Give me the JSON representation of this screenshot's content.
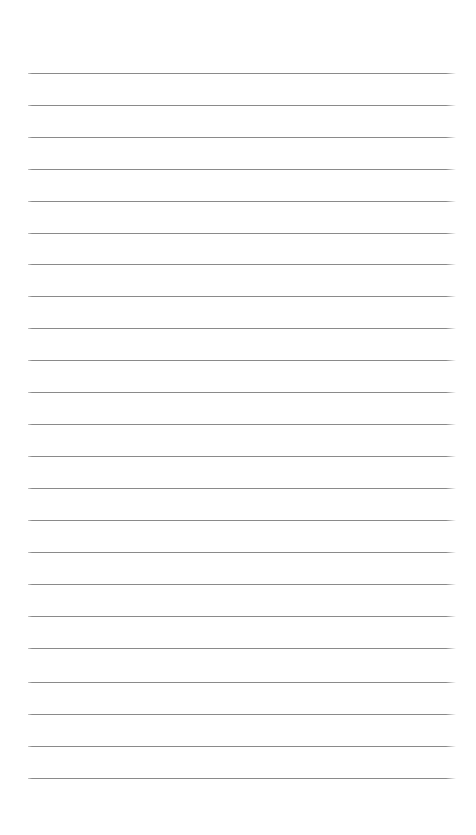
{
  "document": {
    "type": "lined-notepaper",
    "title": "",
    "body_text": "",
    "header_text": "",
    "footer_text": "",
    "page_number": "",
    "content_note": "blank ruled page with no written text"
  },
  "page": {
    "width": 476,
    "height": 835,
    "background_color": "#ffffff",
    "orientation": "portrait"
  },
  "rules": {
    "count": 23,
    "color": "#8a8a8a",
    "thickness": 1,
    "spacing": 32,
    "left_x": 28,
    "right_x": 456,
    "first_y": 73,
    "last_y": 778,
    "y_positions": [
      73,
      105,
      137,
      169,
      201,
      233,
      264,
      296,
      328,
      360,
      392,
      424,
      456,
      488,
      520,
      552,
      584,
      616,
      648,
      682,
      714,
      746,
      778
    ]
  },
  "margins": {
    "top": 73,
    "bottom": 56,
    "left": 28,
    "right": 20
  }
}
